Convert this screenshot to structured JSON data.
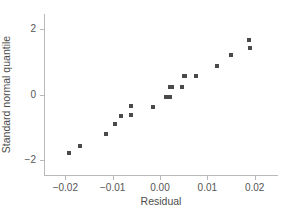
{
  "chart_data": {
    "type": "scatter",
    "title": "",
    "subtitle": "",
    "xlabel": "Residual",
    "ylabel": "Standard normal quantile",
    "xlim": [
      -0.0245,
      0.0245
    ],
    "ylim": [
      -2.45,
      2.45
    ],
    "xticks": [
      -0.02,
      -0.01,
      0.0,
      0.01,
      0.02
    ],
    "xticklabels": [
      "−0.02",
      "−0.01",
      "0.00",
      "0.01",
      "0.02"
    ],
    "yticks": [
      2,
      0,
      -2
    ],
    "yticklabels": [
      "2",
      "0",
      "−2"
    ],
    "grid": false,
    "legend": null,
    "annotations": [],
    "marker": {
      "shape": "square",
      "color": "#4a4a4a",
      "size_px": 4
    },
    "axis_color": "#b9b9b9",
    "background": "#ffffff",
    "n_points": 20,
    "x": [
      -0.0193,
      -0.017,
      -0.0113,
      -0.0094,
      -0.0083,
      -0.0061,
      -0.0061,
      -0.0014,
      0.0012,
      0.0021,
      0.0021,
      0.0026,
      0.0046,
      0.0051,
      0.0052,
      0.0077,
      0.012,
      0.015,
      0.0189,
      0.019
    ],
    "y": [
      -1.78,
      -1.56,
      -1.19,
      -0.9,
      -0.64,
      -0.34,
      -0.61,
      -0.37,
      -0.07,
      -0.07,
      0.22,
      0.22,
      0.24,
      0.55,
      0.55,
      0.55,
      0.87,
      1.2,
      1.67,
      1.43
    ],
    "points": [
      {
        "x": -0.0193,
        "y": -1.78
      },
      {
        "x": -0.017,
        "y": -1.56
      },
      {
        "x": -0.0113,
        "y": -1.19
      },
      {
        "x": -0.0094,
        "y": -0.9
      },
      {
        "x": -0.0083,
        "y": -0.64
      },
      {
        "x": -0.0061,
        "y": -0.34
      },
      {
        "x": -0.0061,
        "y": -0.61
      },
      {
        "x": -0.0014,
        "y": -0.37
      },
      {
        "x": 0.0012,
        "y": -0.07
      },
      {
        "x": 0.0021,
        "y": -0.07
      },
      {
        "x": 0.0021,
        "y": 0.22
      },
      {
        "x": 0.0026,
        "y": 0.22
      },
      {
        "x": 0.0046,
        "y": 0.24
      },
      {
        "x": 0.0051,
        "y": 0.55
      },
      {
        "x": 0.0052,
        "y": 0.55
      },
      {
        "x": 0.0077,
        "y": 0.55
      },
      {
        "x": 0.012,
        "y": 0.87
      },
      {
        "x": 0.015,
        "y": 1.2
      },
      {
        "x": 0.0189,
        "y": 1.67
      },
      {
        "x": 0.019,
        "y": 1.43
      }
    ]
  }
}
